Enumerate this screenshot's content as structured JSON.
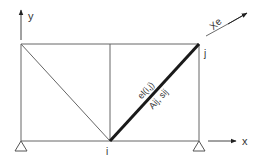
{
  "diagram": {
    "axes": {
      "y_label": "y",
      "x_label": "x"
    },
    "nodes": {
      "i_label": "i",
      "j_label": "j"
    },
    "element": {
      "local_axis_label": "Xe",
      "id_label": "el(i,j)",
      "props_label": "Aij, sij"
    },
    "colors": {
      "line": "#555555",
      "element": "#1a1a1a",
      "text": "#333333"
    }
  }
}
